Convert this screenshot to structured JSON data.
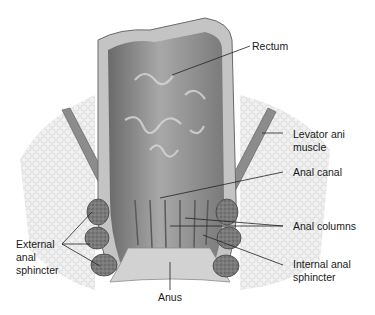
{
  "figure": {
    "labels": {
      "rectum": "Rectum",
      "levator_line1": "Levator ani",
      "levator_line2": "muscle",
      "anal_canal": "Anal canal",
      "anal_columns": "Anal columns",
      "internal_line1": "Internal anal",
      "internal_line2": "sphincter",
      "external_line1": "External",
      "external_line2": "anal",
      "external_line3": "sphincter",
      "anus": "Anus"
    },
    "colors": {
      "background": "#ffffff",
      "lumen": "#8a8a8a",
      "wall": "#b5b5b5",
      "fat": "#ececec",
      "muscle": "#6e6e6e",
      "leader": "#222222"
    }
  }
}
